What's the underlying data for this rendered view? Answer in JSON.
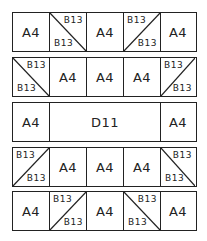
{
  "diagram": {
    "rows": [
      {
        "cells": [
          {
            "type": "square",
            "label": "A4"
          },
          {
            "type": "hst",
            "diag": "tl-br",
            "top": "B13",
            "bottom": "B13"
          },
          {
            "type": "square",
            "label": "A4"
          },
          {
            "type": "hst",
            "diag": "bl-tr",
            "top": "B13",
            "bottom": "B13"
          },
          {
            "type": "square",
            "label": "A4"
          }
        ]
      },
      {
        "cells": [
          {
            "type": "hst",
            "diag": "tl-br",
            "top": "B13",
            "bottom": "B13"
          },
          {
            "type": "square",
            "label": "A4"
          },
          {
            "type": "square",
            "label": "A4"
          },
          {
            "type": "square",
            "label": "A4"
          },
          {
            "type": "hst",
            "diag": "bl-tr",
            "top": "B13",
            "bottom": "B13"
          }
        ]
      },
      {
        "cells": [
          {
            "type": "square",
            "label": "A4"
          },
          {
            "type": "wide",
            "label": "D11"
          },
          {
            "type": "square",
            "label": "A4"
          }
        ]
      },
      {
        "cells": [
          {
            "type": "hst",
            "diag": "bl-tr",
            "top": "B13",
            "bottom": "B13"
          },
          {
            "type": "square",
            "label": "A4"
          },
          {
            "type": "square",
            "label": "A4"
          },
          {
            "type": "square",
            "label": "A4"
          },
          {
            "type": "hst",
            "diag": "tl-br",
            "top": "B13",
            "bottom": "B13"
          }
        ]
      },
      {
        "cells": [
          {
            "type": "square",
            "label": "A4"
          },
          {
            "type": "hst",
            "diag": "bl-tr",
            "top": "B13",
            "bottom": "B13"
          },
          {
            "type": "square",
            "label": "A4"
          },
          {
            "type": "hst",
            "diag": "tl-br",
            "top": "B13",
            "bottom": "B13"
          },
          {
            "type": "square",
            "label": "A4"
          }
        ]
      }
    ]
  }
}
